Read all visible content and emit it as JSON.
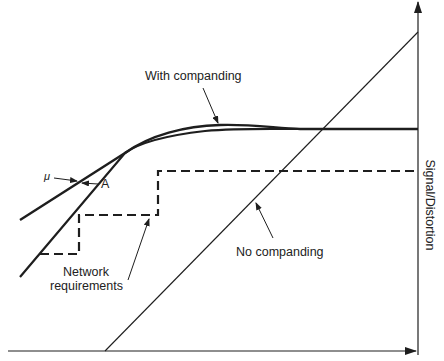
{
  "diagram": {
    "axes": {
      "y_label": "Signal/Distortion",
      "x_label": "",
      "color": "#2a2a2a"
    },
    "curves": [
      {
        "id": "mu",
        "label": "μ",
        "style": "solid-thick"
      },
      {
        "id": "A",
        "label": "A",
        "style": "solid-thick"
      },
      {
        "id": "no-companding",
        "label": "No companding",
        "style": "solid-thin"
      },
      {
        "id": "network-requirements",
        "label": "Network requirements",
        "style": "dashed"
      }
    ],
    "annotations": {
      "with_companding": "With companding",
      "mu": "μ",
      "a": "A",
      "network_line1": "Network",
      "network_line2": "requirements",
      "no_companding": "No companding"
    },
    "colors": {
      "line": "#1e1e1e",
      "background": "#ffffff"
    }
  }
}
